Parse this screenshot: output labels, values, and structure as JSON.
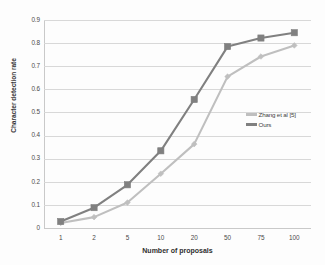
{
  "chart_data": {
    "type": "line",
    "title": "",
    "xlabel": "Number of proposals",
    "ylabel": "Character detection rate",
    "categories": [
      "1",
      "2",
      "5",
      "10",
      "20",
      "50",
      "75",
      "100"
    ],
    "ylim": [
      0,
      0.9
    ],
    "ytick_labels": [
      "0",
      "0.1",
      "0.2",
      "0.3",
      "0.4",
      "0.5",
      "0.6",
      "0.7",
      "0.8",
      "0.9"
    ],
    "ytick_values": [
      0,
      0.1,
      0.2,
      0.3,
      0.4,
      0.5,
      0.6,
      0.7,
      0.8,
      0.9
    ],
    "grid": true,
    "legend_position": "center-right",
    "series": [
      {
        "name": "Zhang et al [5]",
        "color": "#bfbfbf",
        "marker": "diamond",
        "values": [
          0.022,
          0.047,
          0.11,
          0.235,
          0.363,
          0.655,
          0.742,
          0.79
        ]
      },
      {
        "name": "Ours",
        "color": "#808080",
        "marker": "square",
        "values": [
          0.028,
          0.088,
          0.187,
          0.334,
          0.556,
          0.785,
          0.822,
          0.845
        ]
      }
    ]
  }
}
